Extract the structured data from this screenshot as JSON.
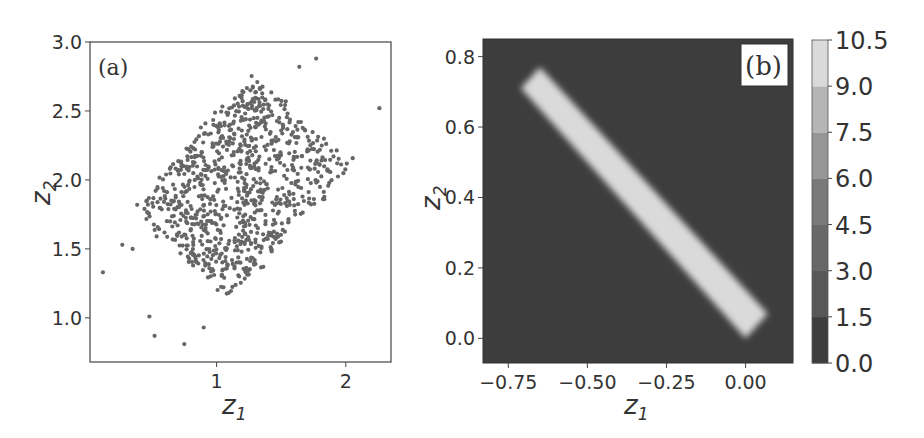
{
  "chart_data": [
    {
      "panel": "a",
      "type": "scatter",
      "panel_label": "(a)",
      "xlabel": "z1",
      "ylabel": "z2",
      "xticks": [
        1,
        2
      ],
      "xtick_labels": [
        "1",
        "2"
      ],
      "yticks": [
        1.0,
        1.5,
        2.0,
        2.5,
        3.0
      ],
      "ytick_labels": [
        "1.0",
        "1.5",
        "2.0",
        "2.5",
        "3.0"
      ],
      "xlim": [
        0.02,
        2.35
      ],
      "ylim": [
        0.68,
        3.0
      ],
      "grid": false,
      "marker_color": "#666666",
      "n_points_approx": 900,
      "cloud": {
        "description": "uniform parallelogram cloud, positively correlated",
        "corners": [
          [
            0.35,
            1.8
          ],
          [
            1.3,
            2.75
          ],
          [
            2.2,
            2.2
          ],
          [
            1.1,
            1.15
          ]
        ]
      },
      "outliers": [
        [
          0.12,
          1.33
        ],
        [
          0.27,
          1.53
        ],
        [
          0.48,
          1.01
        ],
        [
          0.52,
          0.87
        ],
        [
          0.75,
          0.81
        ],
        [
          1.77,
          2.88
        ],
        [
          1.64,
          2.82
        ],
        [
          2.26,
          2.52
        ],
        [
          0.9,
          0.93
        ],
        [
          0.35,
          1.5
        ]
      ]
    },
    {
      "panel": "b",
      "type": "heatmap",
      "panel_label": "(b)",
      "xlabel": "z1",
      "ylabel": "z2",
      "xticks": [
        -0.75,
        -0.5,
        -0.25,
        0.0
      ],
      "xtick_labels": [
        "−0.75",
        "−0.50",
        "−0.25",
        "0.00"
      ],
      "yticks": [
        0.0,
        0.2,
        0.4,
        0.6,
        0.8
      ],
      "ytick_labels": [
        "0.0",
        "0.2",
        "0.4",
        "0.6",
        "0.8"
      ],
      "xlim": [
        -0.83,
        0.15
      ],
      "ylim": [
        -0.07,
        0.85
      ],
      "background_value": 0.0,
      "band": {
        "description": "high-density diagonal band from (-0.65,0.77) to (0.05,0.03)",
        "corners": [
          [
            -0.65,
            0.77
          ],
          [
            0.07,
            0.07
          ],
          [
            0.0,
            0.0
          ],
          [
            -0.71,
            0.71
          ]
        ],
        "value": 10.0
      },
      "colorbar": {
        "ticks": [
          0.0,
          1.5,
          3.0,
          4.5,
          6.0,
          7.5,
          9.0,
          10.5
        ],
        "tick_labels": [
          "0.0",
          "1.5",
          "3.0",
          "4.5",
          "6.0",
          "7.5",
          "9.0",
          "10.5"
        ],
        "level_colors": [
          "#3d3d3d",
          "#575757",
          "#686868",
          "#7a7a7a",
          "#969696",
          "#b5b5b5",
          "#dadada"
        ]
      }
    }
  ]
}
